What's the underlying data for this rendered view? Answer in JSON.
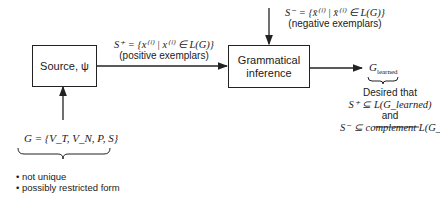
{
  "source_box": {
    "label": "Source, ψ"
  },
  "inference_box": {
    "line1": "Grammatical",
    "line2": "inference"
  },
  "positive": {
    "set": "S⁺ = {x⁽ⁱ⁾ | x⁽ⁱ⁾ ∈ L(G)}",
    "caption": "(positive exemplars)"
  },
  "negative": {
    "set": "S⁻ = {x̄⁽ⁱ⁾ | x̄⁽ⁱ⁾ ∈ L(G)}",
    "caption": "(negative exemplars)"
  },
  "grammar": {
    "definition": "G = {V_T, V_N, P, S}",
    "notes": [
      "not unique",
      "possibly restricted form"
    ]
  },
  "output": {
    "label": "G",
    "subscript": "learned",
    "desired_intro": "Desired that",
    "condition1": "S⁺ ⊆ L(G_learned)",
    "connector": "and",
    "condition2": "S⁻ ⊆ complement L(G_learned)"
  }
}
